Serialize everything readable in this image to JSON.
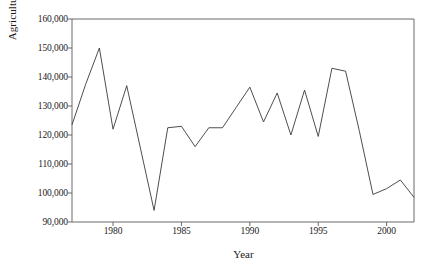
{
  "chart_data": {
    "type": "line",
    "title": "",
    "xlabel": "Year",
    "ylabel": "Agricultural sector",
    "xlim": [
      1977,
      2002
    ],
    "ylim": [
      90000,
      160000
    ],
    "grid": false,
    "legend": "none",
    "y_ticks": [
      "90,000",
      "100,000",
      "110,000",
      "120,000",
      "130,000",
      "140,000",
      "150,000",
      "160,000"
    ],
    "y_tick_values": [
      90000,
      100000,
      110000,
      120000,
      130000,
      140000,
      150000,
      160000
    ],
    "x_ticks": [
      "1980",
      "1985",
      "1990",
      "1995",
      "2000"
    ],
    "x_tick_values": [
      1980,
      1985,
      1990,
      1995,
      2000
    ],
    "series": [
      {
        "name": "Agricultural sector",
        "color": "#3a3a3a",
        "x": [
          1977,
          1978,
          1979,
          1980,
          1981,
          1982,
          1983,
          1984,
          1985,
          1986,
          1987,
          1988,
          1989,
          1990,
          1991,
          1992,
          1993,
          1994,
          1995,
          1996,
          1997,
          1998,
          1999,
          2000,
          2001,
          2002
        ],
        "values": [
          123500,
          137500,
          150000,
          122000,
          137000,
          115500,
          94000,
          122500,
          123000,
          116000,
          122500,
          122500,
          129500,
          136500,
          124500,
          134500,
          120000,
          135500,
          119500,
          143000,
          142000,
          121500,
          99500,
          101500,
          104500,
          98500
        ]
      }
    ]
  },
  "axes": {
    "y_title": "Agricultural sector",
    "x_title": "Year"
  }
}
